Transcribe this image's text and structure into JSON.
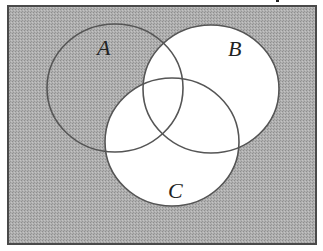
{
  "diagram": {
    "type": "venn",
    "shaded_region": "(B ∪ C)'",
    "colors": {
      "shade": "#a9a9a9",
      "white": "#ffffff",
      "outline": "#555555",
      "border": "#4a4a4a"
    },
    "universe": {
      "x": 8,
      "y": 6,
      "width": 308,
      "height": 238
    },
    "sets": [
      {
        "id": "A",
        "label": "A",
        "cx": 115,
        "cy": 88,
        "rx": 68,
        "ry": 64,
        "label_x": 97,
        "label_y": 55,
        "shaded": true
      },
      {
        "id": "B",
        "label": "B",
        "cx": 211,
        "cy": 89,
        "rx": 68,
        "ry": 64,
        "label_x": 228,
        "label_y": 56,
        "shaded": false
      },
      {
        "id": "C",
        "label": "C",
        "cx": 172,
        "cy": 142,
        "rx": 67,
        "ry": 64,
        "label_x": 168,
        "label_y": 198,
        "shaded": false
      }
    ]
  }
}
